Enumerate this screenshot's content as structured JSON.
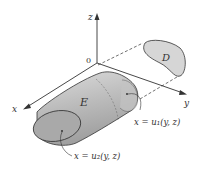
{
  "diagram": {
    "axes": {
      "x_label": "x",
      "y_label": "y",
      "z_label": "z",
      "origin_label": "0"
    },
    "regions": {
      "solid_label": "E",
      "projection_label": "D"
    },
    "surfaces": {
      "back_surface_label": "x = u₁(y, z)",
      "front_surface_label": "x = u₂(y, z)"
    },
    "colors": {
      "solid_fill": "#bdbdbd",
      "solid_end_fill": "#a9a9a9",
      "projection_fill": "#d6d6d6",
      "line": "#333333"
    }
  }
}
